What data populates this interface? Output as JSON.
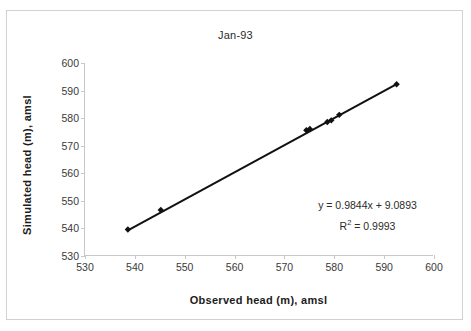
{
  "chart_data": {
    "type": "scatter",
    "title": "Jan-93",
    "xlabel": "Observed head (m), amsl",
    "ylabel": "Simulated head (m), amsl",
    "xlim": [
      530,
      600
    ],
    "ylim": [
      530,
      600
    ],
    "xticks": [
      530,
      540,
      550,
      560,
      570,
      580,
      590,
      600
    ],
    "yticks": [
      530,
      540,
      550,
      560,
      570,
      580,
      590,
      600
    ],
    "grid": false,
    "legend": "none",
    "series": [
      {
        "name": "Head comparison",
        "marker": "diamond",
        "color": "#111111",
        "x": [
          538.6,
          545.2,
          574.4,
          575.1,
          578.6,
          579.4,
          581.0,
          592.5
        ],
        "y": [
          539.6,
          546.7,
          575.6,
          576.1,
          578.6,
          579.2,
          581.2,
          592.3
        ]
      }
    ],
    "trendline": {
      "type": "linear",
      "color": "#111111",
      "slope": 0.9844,
      "intercept": 9.0893,
      "x_start": 538.6,
      "x_end": 592.5
    },
    "annotations": {
      "equation": "y = 0.9844x + 9.0893",
      "r_squared_prefix": "R",
      "r_squared_exponent": "2",
      "r_squared_value": " = 0.9993"
    }
  },
  "colors": {
    "marker": "#111111",
    "line": "#111111",
    "axis": "#c8c8c8",
    "frame": "#d2d2d2",
    "text": "#2b2b2b",
    "axis_title": "#1c1c1c"
  }
}
